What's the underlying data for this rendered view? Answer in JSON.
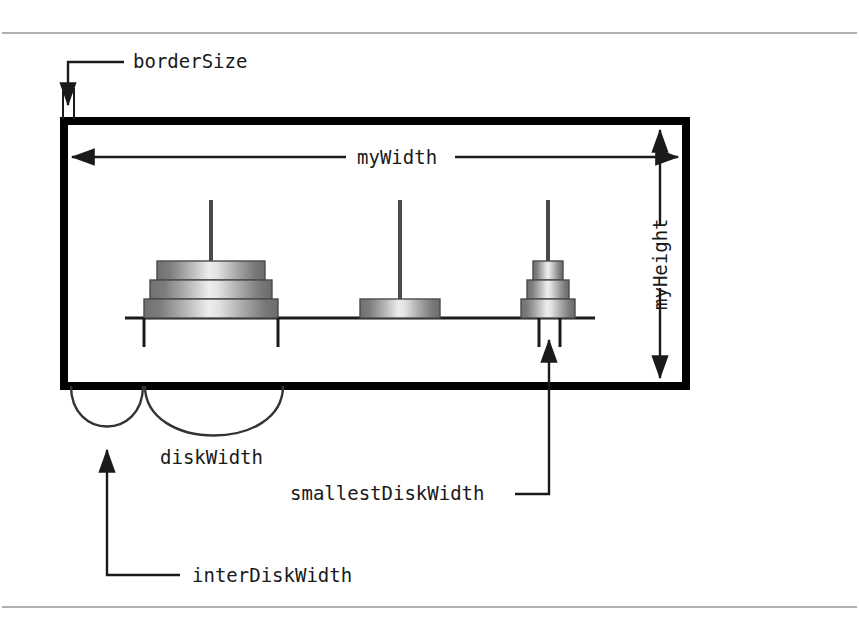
{
  "figure": {
    "kind": "annotated-layout-diagram",
    "colors": {
      "ink": "#1a1a1a",
      "border": "#000000",
      "rule": "#b0b0b0",
      "disk_edge": "#555555",
      "disk_dark": "#6e6e6e",
      "disk_light": "#e8e8e8",
      "background": "#ffffff"
    }
  },
  "labels": {
    "border_size": "borderSize",
    "my_width": "myWidth",
    "my_height": "myHeight",
    "disk_width": "diskWidth",
    "inter_disk_width": "interDiskWidth",
    "smallest_disk_width": "smallestDiskWidth"
  },
  "rules": [
    {
      "name": "top-rule",
      "y": 33
    },
    {
      "name": "bottom-rule",
      "y": 607
    }
  ],
  "panel": {
    "x": 60,
    "y": 117,
    "width": 630,
    "height": 273,
    "border_thickness": 8
  },
  "baseline": {
    "x1": 125,
    "x2": 595,
    "y": 318
  },
  "pegs": [
    {
      "name": "peg-1",
      "center_x": 211,
      "post_top": 200,
      "disks": [
        {
          "index": 1,
          "half_width": 67,
          "label": "largest"
        },
        {
          "index": 2,
          "half_width": 61,
          "label": "middle"
        },
        {
          "index": 3,
          "half_width": 54,
          "label": "smaller"
        }
      ],
      "ticks": [
        144,
        278
      ]
    },
    {
      "name": "peg-2",
      "center_x": 400,
      "post_top": 200,
      "disks": [
        {
          "index": 1,
          "half_width": 40,
          "label": "single"
        }
      ],
      "ticks": []
    },
    {
      "name": "peg-3",
      "center_x": 548,
      "post_top": 200,
      "disks": [
        {
          "index": 1,
          "half_width": 27,
          "label": "largest-small"
        },
        {
          "index": 2,
          "half_width": 21,
          "label": "middle-small"
        },
        {
          "index": 3,
          "half_width": 15,
          "label": "smallest"
        }
      ],
      "ticks": [
        539,
        560
      ]
    }
  ],
  "annotations": [
    {
      "name": "borderSize",
      "label": "borderSize",
      "label_x": 133,
      "label_y": 68,
      "leader": "horizontal-left-then-down",
      "arrow": "down"
    },
    {
      "name": "myWidth",
      "label": "myWidth",
      "label_x": 360,
      "label_y": 164,
      "leader": "double-headed-horizontal",
      "arrow": "both"
    },
    {
      "name": "myHeight",
      "label": "myHeight",
      "label_x": 663,
      "label_y": 255,
      "rotated": "-90",
      "leader": "double-headed-vertical",
      "arrow": "both"
    },
    {
      "name": "diskWidth",
      "label": "diskWidth",
      "label_x": 160,
      "label_y": 464,
      "leader": "arc-brace",
      "arrow": "none"
    },
    {
      "name": "interDiskWidth",
      "label": "interDiskWidth",
      "label_x": 192,
      "label_y": 582,
      "leader": "horizontal-left-then-up",
      "arrow": "up"
    },
    {
      "name": "smallestDiskWidth",
      "label": "smallestDiskWidth",
      "label_x": 290,
      "label_y": 500,
      "leader": "horizontal-right-then-up",
      "arrow": "up"
    }
  ]
}
